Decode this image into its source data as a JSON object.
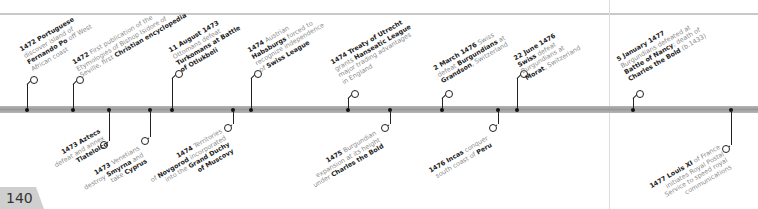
{
  "page": {
    "number": "140"
  },
  "colors": {
    "bar": "#a8a8a8",
    "accent_text": "#222222",
    "muted_text": "#8a8a8a",
    "page_tab": "#cfcfcf"
  },
  "events_top": [
    {
      "x": 27,
      "parts": [
        {
          "b": "1472 Portuguese"
        },
        {
          "t": " discover island of "
        },
        {
          "b": "Fernando Po"
        },
        {
          "t": " off West African coast"
        }
      ],
      "lines": [
        [
          "1472 Portuguese"
        ],
        [
          "discover island of"
        ],
        [
          "Fernando Po off West"
        ],
        [
          "African coast"
        ]
      ]
    },
    {
      "x": 73,
      "lines": [
        [
          "1472 First publication of the"
        ],
        [
          "Etymologies of Bishop Isidore of"
        ],
        [
          "Seville, first Christian encyclopedia"
        ]
      ]
    },
    {
      "x": 172,
      "lines": [
        [
          "11 August 1473"
        ],
        [
          "Ottomans defeat"
        ],
        [
          "Turkomans at Battle"
        ],
        [
          "of Otlukbeli"
        ]
      ]
    },
    {
      "x": 251,
      "lines": [
        [
          "1474 Austrian"
        ],
        [
          "Habsburgs forced to"
        ],
        [
          "recognize independence"
        ],
        [
          "of Swiss League"
        ]
      ]
    },
    {
      "x": 348,
      "lines": [
        [
          "1474 Treaty of Utrecht"
        ],
        [
          "grants Hanseatic League"
        ],
        [
          "major trading advantages"
        ],
        [
          "in England"
        ]
      ]
    },
    {
      "x": 442,
      "lines": [
        [
          "2 March 1476 Swiss"
        ],
        [
          "defeat Burgundians at"
        ],
        [
          "Grandson, Switzerland"
        ]
      ]
    },
    {
      "x": 517,
      "lines": [
        [
          "22 June 1476"
        ],
        [
          "Swiss defeat"
        ],
        [
          "Burgundians at"
        ],
        [
          "Morat, Switzerland"
        ]
      ]
    },
    {
      "x": 633,
      "lines": [
        [
          "5 January 1477"
        ],
        [
          "Burgundians defeated at"
        ],
        [
          "Battle of Nancy; death of"
        ],
        [
          "Charles the Bold (b.1433)"
        ]
      ]
    }
  ],
  "events_bottom": [
    {
      "x": 109,
      "lines": [
        [
          "1473 Aztecs"
        ],
        [
          "defeat and annex"
        ],
        [
          "Tlatelolco"
        ]
      ]
    },
    {
      "x": 150,
      "lines": [
        [
          "1473 Venetians"
        ],
        [
          "destroy Smyrna and"
        ],
        [
          "take Cyprus"
        ]
      ]
    },
    {
      "x": 233,
      "lines": [
        [
          "1474 Territories"
        ],
        [
          "of Novgorod incorporated"
        ],
        [
          "into the Grand Duchy"
        ],
        [
          "of Muscovy"
        ]
      ]
    },
    {
      "x": 390,
      "lines": [
        [
          "1475 Burgundian"
        ],
        [
          "expansion at its height"
        ],
        [
          "under Charles the Bold"
        ]
      ]
    },
    {
      "x": 498,
      "lines": [
        [
          "1476 Incas conquer"
        ],
        [
          "south coast of Peru"
        ]
      ]
    },
    {
      "x": 731,
      "lines": [
        [
          "1477 Louis XI of France"
        ],
        [
          "initiates Royal Postal"
        ],
        [
          "Service to speed royal"
        ],
        [
          "communications"
        ]
      ]
    }
  ],
  "labels": {
    "e1472a": {
      "bold1": "1472 Portuguese",
      "l2": "discover island of",
      "bold3": "Fernando Po",
      "l3": " off West",
      "l4": "African coast"
    },
    "e1472b": {
      "bold1": "1472",
      "l1": " First publication of the",
      "l2": "Etymologies of Bishop Isidore of",
      "l3": "Seville, first ",
      "bold3": "Christian encyclopedia"
    },
    "e1473c": {
      "bold1": "11 August 1473",
      "l2": "Ottomans defeat",
      "bold3": "Turkomans at Battle",
      "bold4": "of Otlukbeli"
    },
    "e1474a": {
      "bold1": "1474",
      "l1": " Austrian",
      "bold2": "Habsburgs",
      "l2": " forced to",
      "l3": "recognize independence",
      "l4": "of ",
      "bold4": "Swiss League"
    },
    "e1474b": {
      "bold1": "1474 Treaty of Utrecht",
      "l2": "grants ",
      "bold2": "Hanseatic League",
      "l3": "major trading advantages",
      "l4": "in England"
    },
    "e1476a": {
      "bold1": "2 March 1476",
      "l1": " Swiss",
      "l2": "defeat ",
      "bold2": "Burgundians",
      "l2b": " at",
      "bold3": "Grandson",
      "l3": ", Switzerland"
    },
    "e1476b": {
      "bold1": "22 June 1476",
      "bold2": "Swiss",
      "l2": " defeat",
      "l3": "Burgundians at",
      "bold4": "Morat",
      "l4": ", Switzerland"
    },
    "e1477a": {
      "bold1": "5 January 1477",
      "l2": "Burgundians defeated at",
      "bold3": "Battle of Nancy",
      "l3": "; death of",
      "bold4": "Charles the Bold",
      "l4": " (b.1433)"
    },
    "e1473a": {
      "bold1": "1473 Aztecs",
      "l2": "defeat and annex",
      "bold3": "Tlatelolco"
    },
    "e1473b": {
      "bold1": "1473",
      "l1": " Venetians",
      "l2": "destroy ",
      "bold2": "Smyrna",
      "l2b": " and",
      "l3": "take ",
      "bold3": "Cyprus"
    },
    "e1474c": {
      "bold1": "1474",
      "l1": " Territories",
      "l2": "of ",
      "bold2": "Novgorod",
      "l2b": " incorporated",
      "l3": "into the ",
      "bold3": "Grand Duchy",
      "bold4": "of Muscovy"
    },
    "e1475": {
      "bold1": "1475",
      "l1": " Burgundian",
      "l2": "expansion at its height",
      "l3": "under ",
      "bold3": "Charles the Bold"
    },
    "e1476c": {
      "bold1": "1476 Incas",
      "l1": " conquer",
      "l2": "south coast of ",
      "bold2": "Peru"
    },
    "e1477b": {
      "bold1": "1477 Louis XI",
      "l1": " of France",
      "l2": "initiates Royal Postal",
      "l3": "Service to speed royal",
      "l4": "communications"
    }
  }
}
